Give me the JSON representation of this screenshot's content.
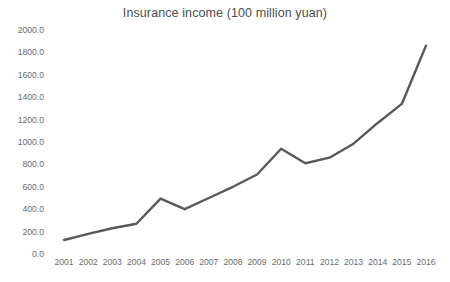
{
  "chart_data": {
    "type": "line",
    "title": "Insurance income (100 million yuan)",
    "xlabel": "",
    "ylabel": "",
    "grid": false,
    "legend": false,
    "legend_position": "none",
    "line_color": "#595959",
    "line_width": 2.4,
    "markers": false,
    "categories": [
      "2001",
      "2002",
      "2003",
      "2004",
      "2005",
      "2006",
      "2007",
      "2008",
      "2009",
      "2010",
      "2011",
      "2012",
      "2013",
      "2014",
      "2015",
      "2016"
    ],
    "values": [
      125,
      180,
      230,
      270,
      495,
      400,
      500,
      600,
      710,
      940,
      810,
      860,
      985,
      1170,
      1340,
      1860
    ],
    "series": [
      {
        "name": "Insurance income",
        "values": [
          125,
          180,
          230,
          270,
          495,
          400,
          500,
          600,
          710,
          940,
          810,
          860,
          985,
          1170,
          1340,
          1860
        ]
      }
    ],
    "ylim": [
      0,
      2000
    ],
    "ytick_values": [
      0,
      200,
      400,
      600,
      800,
      1000,
      1200,
      1400,
      1600,
      1800,
      2000
    ],
    "ytick_labels": [
      "0.0",
      "200.0",
      "400.0",
      "600.0",
      "800.0",
      "1000.0",
      "1200.0",
      "1400.0",
      "1600.0",
      "1800.0",
      "2000.0"
    ],
    "xtick_labels": [
      "2001",
      "2002",
      "2003",
      "2004",
      "2005",
      "2006",
      "2007",
      "2008",
      "2009",
      "2010",
      "2011",
      "2012",
      "2013",
      "2014",
      "2015",
      "2016"
    ]
  }
}
